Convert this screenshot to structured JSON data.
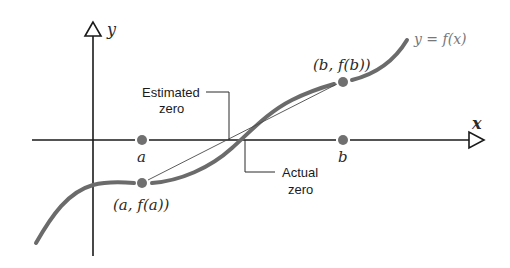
{
  "diagram": {
    "axes": {
      "x_label": "x",
      "y_label": "y"
    },
    "curve_label": "y = f(x)",
    "points": {
      "a_tick_label": "a",
      "b_tick_label": "b",
      "point_a_label": "(a, f(a))",
      "point_b_label": "(b, f(b))"
    },
    "annotations": {
      "estimated_zero_line1": "Estimated",
      "estimated_zero_line2": "zero",
      "actual_zero_line1": "Actual",
      "actual_zero_line2": "zero"
    },
    "colors": {
      "curve": "#6b6b6b",
      "axes": "#1a1a1a",
      "points": "#707070",
      "curve_label": "#777777"
    }
  }
}
